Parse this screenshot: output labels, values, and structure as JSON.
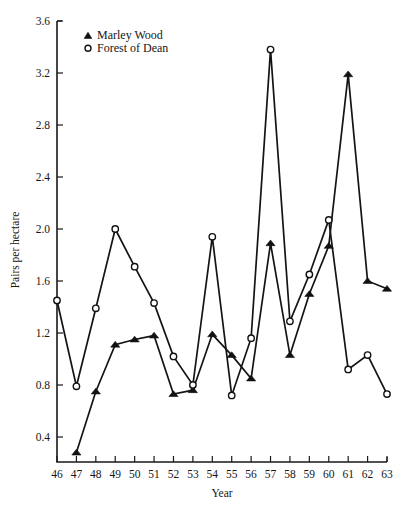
{
  "chart_data": {
    "type": "line",
    "title": "",
    "xlabel": "Year",
    "ylabel": "Pairs per hectare",
    "x": [
      46,
      47,
      48,
      49,
      50,
      51,
      52,
      53,
      54,
      55,
      56,
      57,
      58,
      59,
      60,
      61,
      62,
      63
    ],
    "xtick_labels": [
      "46",
      "47",
      "48",
      "49",
      "50",
      "51",
      "52",
      "53",
      "54",
      "55",
      "56",
      "57",
      "58",
      "59",
      "60",
      "61",
      "62",
      "63"
    ],
    "ytick_labels": [
      "0.4",
      "0.8",
      "1.2",
      "1.6",
      "2.0",
      "2.4",
      "2.8",
      "3.2",
      "3.6"
    ],
    "ytick_values": [
      0.4,
      0.8,
      1.2,
      1.6,
      2.0,
      2.4,
      2.8,
      3.2,
      3.6
    ],
    "xlim": [
      46,
      63
    ],
    "ylim": [
      0.12,
      3.6
    ],
    "grid": false,
    "legend_position": "top-left",
    "series": [
      {
        "name": "Marley Wood",
        "marker": "filled-triangle",
        "x": [
          47,
          48,
          49,
          50,
          51,
          52,
          53,
          54,
          55,
          56,
          57,
          58,
          59,
          60,
          61,
          62,
          63
        ],
        "values": [
          0.28,
          0.75,
          1.11,
          1.15,
          1.18,
          0.73,
          0.76,
          1.19,
          1.03,
          0.85,
          1.89,
          1.03,
          1.5,
          1.87,
          3.19,
          1.6,
          1.54
        ]
      },
      {
        "name": "Forest of Dean",
        "marker": "open-circle",
        "x": [
          46,
          47,
          48,
          49,
          50,
          51,
          52,
          53,
          54,
          55,
          56,
          57,
          58,
          59,
          60,
          61,
          62,
          63
        ],
        "values": [
          1.45,
          0.79,
          1.39,
          2.0,
          1.71,
          1.43,
          1.02,
          0.8,
          1.94,
          0.72,
          1.16,
          3.38,
          1.29,
          1.65,
          2.07,
          0.92,
          1.03,
          0.73
        ]
      }
    ]
  },
  "legend": {
    "entries": [
      {
        "label": "Marley Wood",
        "marker": "filled-triangle"
      },
      {
        "label": "Forest of Dean",
        "marker": "open-circle"
      }
    ]
  },
  "colors": {
    "ink": "#141414",
    "background": "#ffffff"
  }
}
